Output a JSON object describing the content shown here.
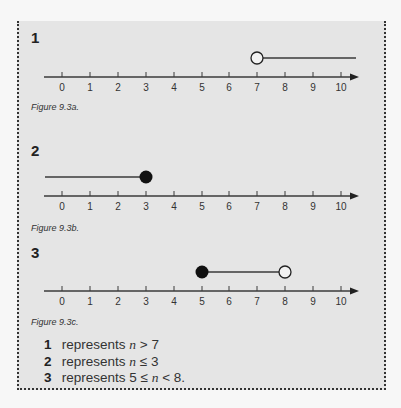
{
  "figures": [
    {
      "number": "1",
      "caption": "Figure 9.3a.",
      "ticks": [
        "0",
        "1",
        "2",
        "3",
        "4",
        "5",
        "6",
        "7",
        "8",
        "9",
        "10"
      ],
      "inequality": {
        "start": 7,
        "start_type": "open",
        "end": "ray-right",
        "end_type": "none"
      }
    },
    {
      "number": "2",
      "caption": "Figure 9.3b.",
      "ticks": [
        "0",
        "1",
        "2",
        "3",
        "4",
        "5",
        "6",
        "7",
        "8",
        "9",
        "10"
      ],
      "inequality": {
        "start": "ray-left",
        "start_type": "none",
        "end": 3,
        "end_type": "closed"
      }
    },
    {
      "number": "3",
      "caption": "Figure 9.3c.",
      "ticks": [
        "0",
        "1",
        "2",
        "3",
        "4",
        "5",
        "6",
        "7",
        "8",
        "9",
        "10"
      ],
      "inequality": {
        "start": 5,
        "start_type": "closed",
        "end": 8,
        "end_type": "open"
      }
    }
  ],
  "explanations": [
    {
      "number": "1",
      "text_prefix": "represents ",
      "var": "n",
      "text_suffix": " > 7"
    },
    {
      "number": "2",
      "text_prefix": "represents ",
      "var": "n",
      "text_suffix": " ≤ 3"
    },
    {
      "number": "3",
      "text_prefix": "represents 5 ≤ ",
      "var": "n",
      "text_suffix": " < 8."
    }
  ],
  "colors": {
    "panel_bg": "#e5e5e5",
    "line": "#3a3a3a",
    "dot": "#111111"
  }
}
